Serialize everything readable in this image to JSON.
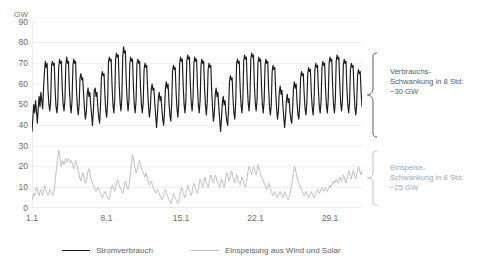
{
  "chart_data": {
    "type": "line",
    "title": "",
    "xlabel": "",
    "ylabel": "GW",
    "ylim": [
      0,
      90
    ],
    "yticks": [
      90,
      80,
      70,
      60,
      50,
      40,
      30,
      20,
      10,
      0
    ],
    "xticks": [
      "1.1",
      "8.1",
      "15.1",
      "22.1",
      "29.1"
    ],
    "xtick_positions": [
      0,
      7,
      14,
      21,
      28
    ],
    "x_range_days": [
      0,
      31
    ],
    "grid": true,
    "legend_position": "bottom",
    "series": [
      {
        "name": "Stromverbrauch",
        "color": "#1a1a1a",
        "unit": "GW",
        "values": [
          37,
          44,
          50,
          46,
          52,
          47,
          41,
          48,
          54,
          49,
          56,
          52,
          48,
          58,
          66,
          71,
          68,
          70,
          57,
          50,
          47,
          52,
          69,
          71,
          69,
          70,
          57,
          49,
          46,
          51,
          68,
          72,
          70,
          71,
          58,
          50,
          47,
          52,
          69,
          73,
          70,
          71,
          58,
          50,
          46,
          52,
          69,
          72,
          70,
          71,
          57,
          49,
          45,
          50,
          63,
          65,
          62,
          63,
          55,
          48,
          43,
          46,
          55,
          58,
          54,
          56,
          50,
          45,
          40,
          47,
          57,
          58,
          54,
          56,
          49,
          44,
          41,
          49,
          63,
          66,
          64,
          65,
          54,
          47,
          44,
          51,
          71,
          73,
          71,
          72,
          59,
          50,
          46,
          52,
          72,
          75,
          73,
          74,
          60,
          51,
          47,
          53,
          73,
          78,
          75,
          76,
          61,
          52,
          47,
          52,
          70,
          73,
          71,
          72,
          59,
          50,
          46,
          52,
          70,
          72,
          70,
          71,
          58,
          50,
          46,
          51,
          67,
          70,
          68,
          69,
          57,
          49,
          44,
          48,
          57,
          60,
          57,
          58,
          51,
          45,
          39,
          45,
          53,
          56,
          52,
          54,
          48,
          43,
          40,
          47,
          58,
          61,
          58,
          60,
          51,
          45,
          42,
          50,
          66,
          69,
          67,
          68,
          56,
          48,
          44,
          51,
          70,
          73,
          71,
          72,
          59,
          50,
          46,
          52,
          71,
          74,
          72,
          73,
          60,
          51,
          47,
          53,
          70,
          73,
          71,
          72,
          59,
          50,
          46,
          52,
          69,
          72,
          70,
          71,
          58,
          50,
          45,
          51,
          67,
          70,
          68,
          69,
          57,
          48,
          42,
          46,
          55,
          58,
          54,
          56,
          49,
          43,
          37,
          43,
          51,
          54,
          50,
          52,
          46,
          42,
          40,
          48,
          61,
          64,
          62,
          63,
          53,
          46,
          43,
          51,
          70,
          72,
          70,
          71,
          58,
          50,
          46,
          52,
          71,
          74,
          72,
          73,
          60,
          51,
          47,
          53,
          72,
          75,
          73,
          74,
          60,
          51,
          47,
          52,
          70,
          73,
          71,
          72,
          59,
          50,
          46,
          52,
          69,
          72,
          70,
          71,
          58,
          49,
          45,
          50,
          66,
          69,
          67,
          68,
          56,
          48,
          43,
          47,
          56,
          59,
          55,
          57,
          50,
          44,
          39,
          44,
          52,
          55,
          51,
          53,
          47,
          43,
          41,
          48,
          58,
          61,
          58,
          60,
          51,
          45,
          43,
          50,
          63,
          66,
          64,
          65,
          55,
          48,
          45,
          51,
          65,
          68,
          66,
          67,
          56,
          49,
          45,
          51,
          67,
          70,
          68,
          69,
          57,
          49,
          46,
          52,
          68,
          71,
          69,
          70,
          58,
          50,
          46,
          52,
          70,
          73,
          71,
          72,
          59,
          50,
          46,
          52,
          71,
          74,
          72,
          73,
          60,
          51,
          47,
          52,
          69,
          72,
          70,
          71,
          58,
          50,
          46,
          51,
          67,
          70,
          68,
          69,
          57,
          49,
          45,
          50,
          64,
          67,
          65,
          66,
          56,
          49
        ]
      },
      {
        "name": "Einspeisung aus Wind und Solar",
        "color": "#b8b8b8",
        "unit": "GW",
        "values": [
          4,
          5,
          7,
          6,
          8,
          10,
          9,
          7,
          6,
          8,
          9,
          7,
          6,
          8,
          11,
          10,
          8,
          7,
          6,
          7,
          9,
          8,
          7,
          6,
          7,
          9,
          13,
          17,
          21,
          25,
          28,
          26,
          22,
          20,
          23,
          22,
          21,
          23,
          24,
          22,
          23,
          24,
          23,
          22,
          23,
          22,
          20,
          19,
          21,
          23,
          22,
          20,
          18,
          16,
          14,
          13,
          15,
          17,
          16,
          14,
          12,
          13,
          15,
          18,
          19,
          17,
          15,
          13,
          12,
          11,
          10,
          9,
          8,
          9,
          10,
          9,
          8,
          7,
          6,
          5,
          6,
          7,
          8,
          7,
          6,
          5,
          4,
          5,
          7,
          9,
          11,
          10,
          9,
          8,
          10,
          12,
          14,
          13,
          11,
          10,
          9,
          8,
          7,
          9,
          11,
          13,
          12,
          10,
          9,
          11,
          14,
          18,
          22,
          26,
          24,
          21,
          19,
          17,
          18,
          20,
          22,
          23,
          21,
          19,
          18,
          17,
          16,
          15,
          17,
          16,
          14,
          12,
          11,
          12,
          13,
          12,
          10,
          9,
          8,
          7,
          8,
          9,
          8,
          7,
          6,
          5,
          4,
          5,
          6,
          8,
          9,
          8,
          6,
          5,
          4,
          3,
          2,
          3,
          5,
          7,
          6,
          5,
          4,
          3,
          2,
          3,
          5,
          8,
          10,
          9,
          7,
          6,
          5,
          7,
          9,
          11,
          10,
          8,
          7,
          6,
          8,
          10,
          12,
          11,
          9,
          8,
          7,
          9,
          12,
          14,
          13,
          11,
          10,
          12,
          15,
          14,
          12,
          11,
          10,
          12,
          14,
          16,
          15,
          13,
          12,
          14,
          16,
          15,
          13,
          12,
          11,
          10,
          12,
          14,
          13,
          11,
          10,
          12,
          15,
          17,
          16,
          14,
          13,
          15,
          18,
          17,
          15,
          13,
          12,
          14,
          16,
          15,
          13,
          12,
          11,
          13,
          15,
          14,
          12,
          11,
          10,
          12,
          15,
          18,
          20,
          19,
          17,
          16,
          18,
          20,
          19,
          17,
          16,
          18,
          21,
          20,
          18,
          16,
          15,
          14,
          13,
          12,
          11,
          10,
          9,
          10,
          12,
          11,
          9,
          8,
          7,
          6,
          7,
          8,
          7,
          6,
          5,
          6,
          7,
          8,
          7,
          6,
          5,
          6,
          8,
          7,
          6,
          5,
          4,
          5,
          7,
          9,
          11,
          14,
          17,
          20,
          19,
          17,
          15,
          13,
          12,
          11,
          10,
          9,
          8,
          7,
          6,
          7,
          8,
          7,
          6,
          5,
          6,
          7,
          8,
          7,
          6,
          5,
          6,
          7,
          8,
          9,
          8,
          7,
          8,
          9,
          10,
          9,
          8,
          9,
          10,
          9,
          8,
          9,
          10,
          11,
          10,
          11,
          12,
          13,
          12,
          13,
          14,
          13,
          12,
          13,
          15,
          14,
          13,
          14,
          16,
          15,
          13,
          12,
          14,
          16,
          18,
          17,
          15,
          14,
          16,
          18,
          17,
          15,
          14,
          16,
          18,
          20,
          19,
          17,
          16,
          18
        ]
      }
    ],
    "annotations": [
      {
        "id": "consumption-swing",
        "lines": [
          "Verbrauchs-",
          "Schwankung in 8 Std:",
          "~30 GW"
        ],
        "color": "#5a5a5a"
      },
      {
        "id": "feedin-swing",
        "lines": [
          "Einspeise-",
          "Schwankung in 8 Std:",
          "~25 GW"
        ],
        "color": "#a6a6a6"
      }
    ]
  },
  "legend": {
    "items": [
      {
        "label": "Stromverbrauch",
        "color": "#1a1a1a"
      },
      {
        "label": "Einspeisung aus Wind und Solar",
        "color": "#b8b8b8"
      }
    ]
  }
}
